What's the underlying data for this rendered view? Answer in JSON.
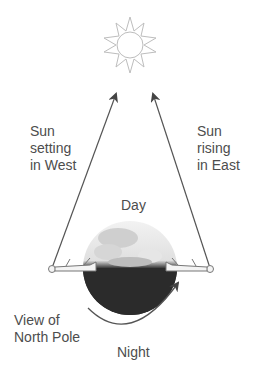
{
  "diagram": {
    "sun": {
      "icon": "sun-icon"
    },
    "labels": {
      "west": [
        "Sun",
        "setting",
        "in West"
      ],
      "east": [
        "Sun",
        "rising",
        "in East"
      ],
      "day": "Day",
      "view": [
        "View of",
        "North Pole"
      ],
      "night": "Night"
    },
    "colors": {
      "line": "#555555",
      "earth_dark": "#2e2e2e",
      "earth_light": "#d9d9d9",
      "sun": "#bdbdbd",
      "text": "#4d4d4d"
    }
  }
}
